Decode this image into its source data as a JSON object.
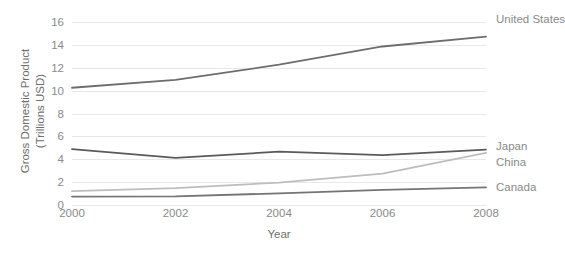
{
  "chart_data": {
    "type": "line",
    "title": "",
    "xlabel": "Year",
    "ylabel": "Gross Domestic Product (Trillions USD)",
    "ylabel_line1": "Gross Domestic Product",
    "ylabel_line2": "(Trillions USD)",
    "x": [
      2000,
      2002,
      2004,
      2006,
      2008
    ],
    "xtick_labels": [
      "2000",
      "2002",
      "2004",
      "2006",
      "2008"
    ],
    "ytick_labels": [
      "0",
      "2",
      "4",
      "6",
      "8",
      "10",
      "12",
      "14",
      "16"
    ],
    "yticks": [
      0,
      2,
      4,
      6,
      8,
      10,
      12,
      14,
      16
    ],
    "ylim": [
      0,
      16
    ],
    "xlim": [
      2000,
      2008
    ],
    "grid": true,
    "legend_position": "right-inline-end-labels",
    "series": [
      {
        "name": "United States",
        "values": [
          10.25,
          10.94,
          12.27,
          13.86,
          14.72
        ],
        "color": "#6d6d6d"
      },
      {
        "name": "Japan",
        "values": [
          4.89,
          4.12,
          4.66,
          4.36,
          4.85
        ],
        "color": "#5a5a5a"
      },
      {
        "name": "China",
        "values": [
          1.21,
          1.47,
          1.96,
          2.75,
          4.55
        ],
        "color": "#bdbdbd"
      },
      {
        "name": "Canada",
        "values": [
          0.74,
          0.76,
          1.02,
          1.32,
          1.54
        ],
        "color": "#747474"
      }
    ]
  },
  "colors": {
    "background": "#ffffff",
    "gridline": "#e8e8e8",
    "tick_text": "#8a8a8a",
    "axis_title_text": "#6e6e6e"
  }
}
